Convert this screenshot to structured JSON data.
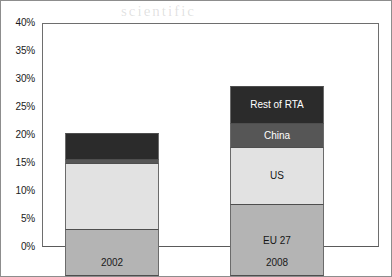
{
  "chart_data": {
    "type": "bar",
    "subtype": "stacked-column",
    "title": "",
    "xlabel": "",
    "ylabel": "",
    "categories": [
      "2002",
      "2008"
    ],
    "series": [
      {
        "name": "EU 27",
        "values": [
          8.3,
          12.8
        ],
        "color": "#b4b4b4"
      },
      {
        "name": "US",
        "values": [
          11.9,
          10.3
        ],
        "color": "#e2e2e2"
      },
      {
        "name": "China",
        "values": [
          0.7,
          4.2
        ],
        "color": "#565656"
      },
      {
        "name": "Rest of RTA",
        "values": [
          4.7,
          6.7
        ],
        "color": "#2b2b2b"
      }
    ],
    "totals": [
      25.6,
      34.0
    ],
    "ylim": [
      0,
      40
    ],
    "ytick_labels": [
      "40%",
      "35%",
      "30%",
      "25%",
      "20%",
      "15%",
      "10%",
      "5%",
      "0%"
    ],
    "ytick_values": [
      40,
      35,
      30,
      25,
      20,
      15,
      10,
      5,
      0
    ],
    "grid": false,
    "legend": "in-bar-labels",
    "labelled_bar": "2008"
  },
  "ghost_text": {
    "line1": "scientific",
    "line2": "integrating a",
    "line3": "the",
    "line4": "international",
    "line5": "the first",
    "line6": "economic"
  }
}
